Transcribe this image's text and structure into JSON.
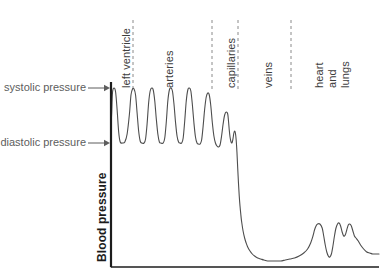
{
  "figure": {
    "axis_label_y": "Blood pressure",
    "annotations": [
      {
        "name": "systolic",
        "text": "systolic pressure",
        "x": 8,
        "y": 88
      },
      {
        "name": "diastolic",
        "text": "diastolic pressure",
        "x": 8,
        "y": 143
      }
    ],
    "segment_labels": [
      {
        "name": "left-ventricle",
        "lines": [
          "left ventricle"
        ],
        "x": 120,
        "y": 88
      },
      {
        "name": "arteries",
        "lines": [
          "arteries"
        ],
        "x": 163,
        "y": 88
      },
      {
        "name": "capillaries",
        "lines": [
          "capillaries"
        ],
        "x": 225,
        "y": 88
      },
      {
        "name": "veins",
        "lines": [
          "veins"
        ],
        "x": 262,
        "y": 88
      },
      {
        "name": "heart-and-lungs",
        "lines": [
          "heart",
          "and",
          "lungs"
        ],
        "x": 313,
        "y": 88
      }
    ],
    "dividers": [
      {
        "name": "divider-left-ventricle-arteries",
        "x": 133
      },
      {
        "name": "divider-arteries-capillaries",
        "x": 212
      },
      {
        "name": "divider-capillaries-veins",
        "x": 238
      },
      {
        "name": "divider-veins-heart",
        "x": 291
      }
    ],
    "colors": {
      "curve": "#4d4d4d",
      "axis": "#1c1c1c",
      "divider": "#8a8a8a",
      "annotation_text": "#5d5d5d",
      "segment_text": "#3d3d3d",
      "background": "#ffffff"
    }
  },
  "chart_data": {
    "type": "line",
    "title": "",
    "xlabel": "",
    "ylabel": "Blood pressure",
    "grid": false,
    "legend": null,
    "axes": {
      "x_axis_y_px": 267,
      "y_axis_x_px": 111,
      "x_start_px": 111,
      "x_end_px": 379,
      "y_top_px": 20
    },
    "reference_levels": [
      {
        "name": "systolic pressure",
        "y_px": 88
      },
      {
        "name": "diastolic pressure",
        "y_px": 143
      }
    ],
    "segments": [
      {
        "name": "left ventricle",
        "x_start_px": 111,
        "x_end_px": 133
      },
      {
        "name": "arteries",
        "x_start_px": 133,
        "x_end_px": 212
      },
      {
        "name": "capillaries",
        "x_start_px": 212,
        "x_end_px": 238
      },
      {
        "name": "veins",
        "x_start_px": 238,
        "x_end_px": 291
      },
      {
        "name": "heart and lungs",
        "x_start_px": 291,
        "x_end_px": 379
      }
    ],
    "points": [
      [
        111,
        267
      ],
      [
        111,
        143
      ],
      [
        112,
        110
      ],
      [
        113,
        92
      ],
      [
        115,
        88
      ],
      [
        117,
        92
      ],
      [
        119,
        110
      ],
      [
        121,
        132
      ],
      [
        123,
        142
      ],
      [
        126,
        143
      ],
      [
        129,
        142
      ],
      [
        132,
        134
      ],
      [
        135,
        114
      ],
      [
        137,
        95
      ],
      [
        139,
        89
      ],
      [
        141,
        89
      ],
      [
        143,
        95
      ],
      [
        145,
        113
      ],
      [
        147,
        131
      ],
      [
        149,
        141
      ],
      [
        151,
        143
      ],
      [
        154,
        143
      ],
      [
        156,
        139
      ],
      [
        158,
        124
      ],
      [
        160,
        103
      ],
      [
        162,
        91
      ],
      [
        164,
        88
      ],
      [
        166,
        90
      ],
      [
        168,
        101
      ],
      [
        170,
        119
      ],
      [
        172,
        134
      ],
      [
        174,
        142
      ],
      [
        176,
        143
      ],
      [
        179,
        143
      ],
      [
        181,
        138
      ],
      [
        183,
        122
      ],
      [
        185,
        101
      ],
      [
        187,
        90
      ],
      [
        189,
        88
      ],
      [
        191,
        91
      ],
      [
        193,
        104
      ],
      [
        195,
        122
      ],
      [
        197,
        136
      ],
      [
        199,
        142
      ],
      [
        201,
        143
      ],
      [
        203,
        143
      ],
      [
        205,
        138
      ],
      [
        207,
        121
      ],
      [
        209,
        101
      ],
      [
        211,
        90
      ],
      [
        213,
        88
      ],
      [
        215,
        91
      ],
      [
        217,
        105
      ],
      [
        219,
        123
      ],
      [
        221,
        137
      ],
      [
        223,
        143
      ],
      [
        225,
        144
      ],
      [
        227,
        144
      ],
      [
        229,
        140
      ],
      [
        231,
        126
      ],
      [
        233,
        109
      ],
      [
        235,
        97
      ],
      [
        237,
        93
      ],
      [
        239,
        95
      ],
      [
        241,
        106
      ],
      [
        243,
        123
      ],
      [
        245,
        136
      ],
      [
        247,
        143
      ],
      [
        249,
        146
      ],
      [
        251,
        147
      ],
      [
        253,
        145
      ],
      [
        255,
        136
      ],
      [
        257,
        124
      ],
      [
        259,
        115
      ],
      [
        261,
        112
      ],
      [
        263,
        114
      ],
      [
        264,
        121
      ],
      [
        265,
        130
      ],
      [
        266,
        137
      ],
      [
        267,
        141
      ],
      [
        268,
        143
      ],
      [
        269,
        142
      ],
      [
        270,
        138
      ],
      [
        271,
        133
      ],
      [
        272,
        131
      ],
      [
        273,
        133
      ],
      [
        274,
        140
      ],
      [
        275,
        152
      ],
      [
        276,
        168
      ],
      [
        277,
        183
      ],
      [
        278,
        196
      ],
      [
        279,
        206
      ],
      [
        280,
        214
      ],
      [
        281,
        221
      ],
      [
        283,
        231
      ],
      [
        285,
        238
      ],
      [
        287,
        243
      ],
      [
        289,
        247
      ],
      [
        292,
        251
      ],
      [
        295,
        254
      ],
      [
        298,
        256
      ],
      [
        302,
        258
      ],
      [
        306,
        259
      ],
      [
        310,
        260
      ],
      [
        315,
        261
      ],
      [
        320,
        261
      ],
      [
        326,
        261
      ],
      [
        332,
        261
      ],
      [
        338,
        260
      ],
      [
        344,
        259
      ],
      [
        350,
        258
      ],
      [
        356,
        256
      ],
      [
        362,
        253
      ],
      [
        367,
        249
      ],
      [
        371,
        243
      ],
      [
        374,
        236
      ],
      [
        376,
        230
      ],
      [
        378,
        226
      ],
      [
        380,
        224
      ],
      [
        383,
        224
      ],
      [
        386,
        228
      ],
      [
        388,
        236
      ],
      [
        390,
        245
      ],
      [
        392,
        252
      ],
      [
        394,
        256
      ],
      [
        396,
        257
      ],
      [
        398,
        254
      ],
      [
        400,
        246
      ],
      [
        402,
        236
      ],
      [
        404,
        228
      ],
      [
        406,
        224
      ],
      [
        408,
        223
      ],
      [
        410,
        226
      ],
      [
        412,
        232
      ],
      [
        414,
        236
      ],
      [
        416,
        235
      ],
      [
        418,
        230
      ],
      [
        420,
        225
      ],
      [
        422,
        224
      ],
      [
        424,
        226
      ],
      [
        426,
        231
      ],
      [
        428,
        236
      ],
      [
        430,
        238
      ],
      [
        433,
        241
      ],
      [
        436,
        245
      ],
      [
        440,
        249
      ],
      [
        444,
        252
      ],
      [
        448,
        253
      ],
      [
        452,
        254
      ],
      [
        456,
        254
      ],
      [
        460,
        254
      ]
    ]
  }
}
